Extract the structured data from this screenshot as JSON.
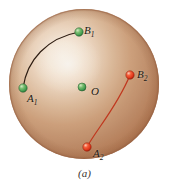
{
  "figure": {
    "caption": "(a)",
    "sphere": {
      "center_x": 84,
      "center_y": 84,
      "radius": 75,
      "base_color": "#c08c68",
      "highlight_color": "#fdf6ee",
      "rim_color": "#a9714f",
      "edge_color": "#9d6544"
    },
    "background_color": "#ffffff"
  },
  "points": [
    {
      "id": "A1",
      "label": "A",
      "subscript": "1",
      "color": "#3f9a4e",
      "x": 23,
      "y": 88,
      "radius": 4
    },
    {
      "id": "B1",
      "label": "B",
      "subscript": "1",
      "color": "#3f9a4e",
      "x": 79,
      "y": 32,
      "radius": 4
    },
    {
      "id": "O",
      "label": "O",
      "subscript": "",
      "color": "#3f9a4e",
      "x": 82,
      "y": 87,
      "radius": 4
    },
    {
      "id": "B2",
      "label": "B",
      "subscript": "2",
      "color": "#e03318",
      "x": 130,
      "y": 75,
      "radius": 4
    },
    {
      "id": "A2",
      "label": "A",
      "subscript": "2",
      "color": "#e03318",
      "x": 87,
      "y": 147,
      "radius": 4
    }
  ],
  "curves": [
    {
      "id": "curve-A1-B1",
      "from": "A1",
      "to": "B1",
      "color": "#2e1d12",
      "width": 1.2,
      "path": "M 23 88 C 27 60, 47 38, 79 32"
    },
    {
      "id": "curve-A2-B2",
      "from": "A2",
      "to": "B2",
      "color": "#c0381f",
      "width": 1.2,
      "path": "M 87 147 C 96 130, 116 106, 130 75"
    }
  ],
  "colors": {
    "green_point": "#3f9a4e",
    "red_point": "#e03318",
    "dark_curve": "#2e1d12",
    "red_curve": "#c0381f",
    "sphere_tan": "#c08c68",
    "label_text": "#231a14"
  }
}
